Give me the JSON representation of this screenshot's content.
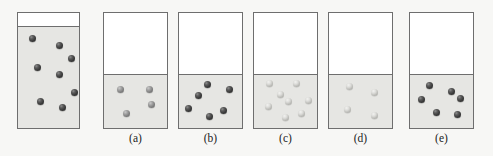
{
  "figure": {
    "background_color": "#f7f7f5",
    "container_border_color": "#6e6e6e",
    "liquid_color": "#e6e6e3",
    "headspace_color": "#ffffff",
    "dot_colors": {
      "dark": "#3a3a3a",
      "mid": "#7e7e7e",
      "light": "#c8c8c4"
    },
    "containers": [
      {
        "id": "reference",
        "label": "",
        "x": 17,
        "y": 12,
        "width": 63,
        "height": 117,
        "fill_top_px": 12,
        "fill_level_percent": 89,
        "particle_count": 8,
        "particle_shade": "dark",
        "particle_size": 7,
        "particles": [
          {
            "x": 14,
            "y": 25
          },
          {
            "x": 41,
            "y": 32
          },
          {
            "x": 53,
            "y": 45
          },
          {
            "x": 19,
            "y": 54
          },
          {
            "x": 41,
            "y": 61
          },
          {
            "x": 56,
            "y": 79
          },
          {
            "x": 22,
            "y": 88
          },
          {
            "x": 44,
            "y": 94
          }
        ]
      },
      {
        "id": "a",
        "label": "(a)",
        "x": 103,
        "y": 12,
        "width": 65,
        "height": 117,
        "fill_top_px": 60,
        "fill_level_percent": 49,
        "particle_count": 4,
        "particle_shade": "mid",
        "particle_size": 7,
        "particles": [
          {
            "x": 16,
            "y": 76
          },
          {
            "x": 45,
            "y": 76
          },
          {
            "x": 47,
            "y": 91
          },
          {
            "x": 22,
            "y": 100
          }
        ]
      },
      {
        "id": "b",
        "label": "(b)",
        "x": 178,
        "y": 12,
        "width": 65,
        "height": 117,
        "fill_top_px": 60,
        "fill_level_percent": 49,
        "particle_count": 6,
        "particle_shade": "dark",
        "particle_size": 7,
        "particles": [
          {
            "x": 28,
            "y": 71
          },
          {
            "x": 50,
            "y": 76
          },
          {
            "x": 19,
            "y": 82
          },
          {
            "x": 9,
            "y": 95
          },
          {
            "x": 44,
            "y": 97
          },
          {
            "x": 30,
            "y": 103
          }
        ]
      },
      {
        "id": "c",
        "label": "(c)",
        "x": 253,
        "y": 12,
        "width": 65,
        "height": 117,
        "fill_top_px": 60,
        "fill_level_percent": 49,
        "particle_count": 8,
        "particle_shade": "light",
        "particle_size": 7,
        "particles": [
          {
            "x": 15,
            "y": 70
          },
          {
            "x": 42,
            "y": 70
          },
          {
            "x": 26,
            "y": 81
          },
          {
            "x": 34,
            "y": 88
          },
          {
            "x": 54,
            "y": 87
          },
          {
            "x": 14,
            "y": 93
          },
          {
            "x": 47,
            "y": 100
          },
          {
            "x": 31,
            "y": 104
          }
        ]
      },
      {
        "id": "d",
        "label": "(d)",
        "x": 328,
        "y": 12,
        "width": 65,
        "height": 117,
        "fill_top_px": 60,
        "fill_level_percent": 49,
        "particle_count": 4,
        "particle_shade": "light",
        "particle_size": 7,
        "particles": [
          {
            "x": 20,
            "y": 73
          },
          {
            "x": 45,
            "y": 79
          },
          {
            "x": 18,
            "y": 96
          },
          {
            "x": 45,
            "y": 102
          }
        ]
      },
      {
        "id": "e",
        "label": "(e)",
        "x": 409,
        "y": 12,
        "width": 65,
        "height": 117,
        "fill_top_px": 60,
        "fill_level_percent": 49,
        "particle_count": 6,
        "particle_shade": "dark",
        "particle_size": 7,
        "particles": [
          {
            "x": 19,
            "y": 72
          },
          {
            "x": 41,
            "y": 78
          },
          {
            "x": 11,
            "y": 86
          },
          {
            "x": 50,
            "y": 85
          },
          {
            "x": 26,
            "y": 99
          },
          {
            "x": 47,
            "y": 101
          }
        ]
      }
    ],
    "captions": [
      {
        "text": "(a)",
        "x": 103,
        "width": 65,
        "y": 132
      },
      {
        "text": "(b)",
        "x": 178,
        "width": 65,
        "y": 132
      },
      {
        "text": "(c)",
        "x": 253,
        "width": 65,
        "y": 132
      },
      {
        "text": "(d)",
        "x": 328,
        "width": 65,
        "y": 132
      },
      {
        "text": "(e)",
        "x": 409,
        "width": 65,
        "y": 132
      }
    ]
  }
}
